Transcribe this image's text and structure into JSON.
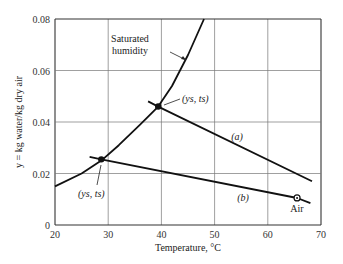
{
  "chart_data": {
    "type": "line",
    "title": "",
    "xlabel": "Temperature, °C",
    "ylabel": "y = kg water/kg dry air",
    "xlim": [
      20,
      70
    ],
    "ylim": [
      0,
      0.08
    ],
    "x_ticks": [
      20,
      30,
      40,
      50,
      60,
      70
    ],
    "y_ticks": [
      0,
      0.02,
      0.04,
      0.06,
      0.08
    ],
    "x_tick_labels": [
      "20",
      "30",
      "40",
      "50",
      "60",
      "70"
    ],
    "y_tick_labels": [
      "0",
      "0.02",
      "0.04",
      "0.06",
      "0.08"
    ],
    "grid": true,
    "legend": null,
    "series": [
      {
        "name": "Saturated humidity",
        "x": [
          20,
          25,
          28.7,
          32,
          36,
          39.4,
          42,
          45,
          48
        ],
        "y": [
          0.015,
          0.02,
          0.025,
          0.031,
          0.039,
          0.046,
          0.054,
          0.066,
          0.08
        ]
      },
      {
        "name": "(a)",
        "x": [
          37.5,
          39.4,
          68.3
        ],
        "y": [
          0.048,
          0.046,
          0.017
        ]
      },
      {
        "name": "(b)",
        "x": [
          26.5,
          28.7,
          65.5,
          68.0
        ],
        "y": [
          0.0265,
          0.0255,
          0.0105,
          0.0085
        ]
      }
    ],
    "points": [
      {
        "label": "(y_s, t_s)",
        "x": 39.4,
        "y": 0.046,
        "style": "filled"
      },
      {
        "label": "(y_s, t_s)",
        "x": 28.7,
        "y": 0.0255,
        "style": "filled"
      },
      {
        "label": "Air",
        "x": 65.5,
        "y": 0.0105,
        "style": "open"
      }
    ],
    "annotations": [
      {
        "text": "Saturated humidity",
        "x": 31.5,
        "y": 0.068
      },
      {
        "text": "(a)",
        "x": 57,
        "y": 0.035
      },
      {
        "text": "(b)",
        "x": 52,
        "y": 0.012
      },
      {
        "text": "Air",
        "x": 65.5,
        "y": 0.0055
      }
    ]
  },
  "labels": {
    "xlabel": "Temperature, °C",
    "ylabel": "y = kg water/kg dry air",
    "sat_line1": "Saturated",
    "sat_line2": "humidity",
    "point_upper": "(ys, ts)",
    "point_lower": "(ys, ts)",
    "curve_a": "(a)",
    "curve_b": "(b)",
    "air": "Air"
  }
}
